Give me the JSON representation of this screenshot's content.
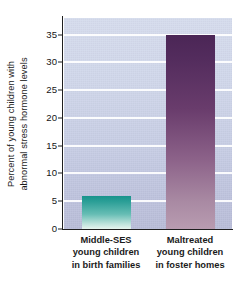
{
  "chart_data": {
    "type": "bar",
    "title": "",
    "subtitle": "",
    "xlabel": "",
    "ylabel": "Percent of young children with abnormal stress hormone levels",
    "ylabel_lines": [
      "Percent of young children with",
      "abnormal stress hormone levels"
    ],
    "categories": [
      "Middle-SES young children in birth families",
      "Maltreated young children in foster homes"
    ],
    "category_lines": [
      [
        "Middle-SES",
        "young children",
        "in birth families"
      ],
      [
        "Maltreated",
        "young children",
        "in foster homes"
      ]
    ],
    "values": [
      6,
      35
    ],
    "ylim": [
      0,
      38
    ],
    "yticks": [
      0,
      5,
      10,
      15,
      20,
      25,
      30,
      35
    ],
    "ytick_labels": [
      "0",
      "5",
      "10",
      "15",
      "20",
      "25",
      "30",
      "35"
    ],
    "grid": true,
    "grid_axis": "y",
    "legend": "none",
    "bar_colors": [
      "#18938c",
      "#4b2656"
    ],
    "bar_color_names": [
      "teal",
      "purple"
    ],
    "plot_background": "#ccd3e7",
    "gridline_color": "#ffffff",
    "axis_color": "#1f1f1f",
    "page_background": "#ffffff"
  }
}
